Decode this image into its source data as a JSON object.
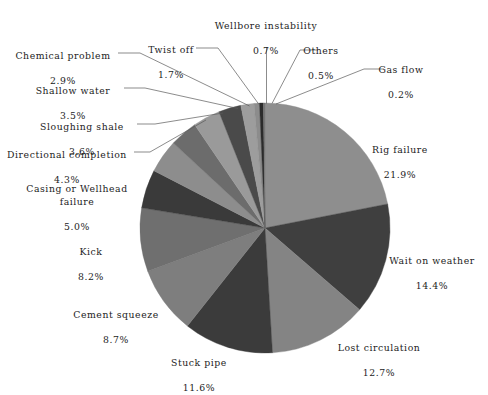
{
  "chart_data": {
    "type": "pie",
    "title": "",
    "subtitle": "",
    "xlabel": "",
    "ylabel": "",
    "legend_position": "callout-labels",
    "grid": false,
    "units": "percent",
    "total": 100.0,
    "start_angle_deg": -90,
    "direction": "clockwise",
    "categories": [
      "Rig failure",
      "Wait on weather",
      "Lost circulation",
      "Stuck pipe",
      "Cement squeeze",
      "Kick",
      "Casing or Wellhead failure",
      "Directional completion",
      "Sloughing shale",
      "Shallow water",
      "Chemical problem",
      "Twist off",
      "Wellbore instability",
      "Others",
      "Gas flow"
    ],
    "values": [
      21.9,
      14.4,
      12.7,
      11.6,
      8.7,
      8.2,
      5.0,
      4.3,
      3.6,
      3.5,
      2.9,
      1.7,
      0.7,
      0.5,
      0.2
    ],
    "value_labels": [
      "21.9%",
      "14.4%",
      "12.7%",
      "11.6%",
      "8.7%",
      "8.2%",
      "5.0%",
      "4.3%",
      "3.6%",
      "3.5%",
      "2.9%",
      "1.7%",
      "0.7%",
      "0.5%",
      "0.2%"
    ],
    "slice_colors": [
      "#8e8e8e",
      "#3f3f3f",
      "#848484",
      "#3b3b3b",
      "#7e7e7e",
      "#6f6f6f",
      "#3a3a3a",
      "#8d8d8d",
      "#6c6c6c",
      "#9a9a9a",
      "#4a4a4a",
      "#9d9d9d",
      "#8c8c8c",
      "#2b2b2b",
      "#767676"
    ],
    "slices": [
      {
        "label": "Rig failure",
        "value": 21.9,
        "value_label": "21.9%",
        "color": "#8e8e8e"
      },
      {
        "label": "Wait on weather",
        "value": 14.4,
        "value_label": "14.4%",
        "color": "#3f3f3f"
      },
      {
        "label": "Lost circulation",
        "value": 12.7,
        "value_label": "12.7%",
        "color": "#848484"
      },
      {
        "label": "Stuck pipe",
        "value": 11.6,
        "value_label": "11.6%",
        "color": "#3b3b3b"
      },
      {
        "label": "Cement squeeze",
        "value": 8.7,
        "value_label": "8.7%",
        "color": "#7e7e7e"
      },
      {
        "label": "Kick",
        "value": 8.2,
        "value_label": "8.2%",
        "color": "#6f6f6f"
      },
      {
        "label": "Casing or Wellhead failure",
        "value": 5.0,
        "value_label": "5.0%",
        "color": "#3a3a3a"
      },
      {
        "label": "Directional completion",
        "value": 4.3,
        "value_label": "4.3%",
        "color": "#8d8d8d"
      },
      {
        "label": "Sloughing shale",
        "value": 3.6,
        "value_label": "3.6%",
        "color": "#6c6c6c"
      },
      {
        "label": "Shallow water",
        "value": 3.5,
        "value_label": "3.5%",
        "color": "#9a9a9a"
      },
      {
        "label": "Chemical problem",
        "value": 2.9,
        "value_label": "2.9%",
        "color": "#4a4a4a"
      },
      {
        "label": "Twist off",
        "value": 1.7,
        "value_label": "1.7%",
        "color": "#9d9d9d"
      },
      {
        "label": "Wellbore instability",
        "value": 0.7,
        "value_label": "0.7%",
        "color": "#8c8c8c"
      },
      {
        "label": "Others",
        "value": 0.5,
        "value_label": "0.5%",
        "color": "#2b2b2b"
      },
      {
        "label": "Gas flow",
        "value": 0.2,
        "value_label": "0.2%",
        "color": "#767676"
      }
    ]
  },
  "labels": {
    "rig_failure": {
      "name": "Rig failure",
      "pct": "21.9%"
    },
    "wait_on_weather": {
      "name": "Wait on weather",
      "pct": "14.4%"
    },
    "lost_circulation": {
      "name": "Lost circulation",
      "pct": "12.7%"
    },
    "stuck_pipe": {
      "name": "Stuck pipe",
      "pct": "11.6%"
    },
    "cement_squeeze": {
      "name": "Cement squeeze",
      "pct": "8.7%"
    },
    "kick": {
      "name": "Kick",
      "pct": "8.2%"
    },
    "casing_wellhead": {
      "name": "Casing or Wellhead\nfailure",
      "pct": "5.0%"
    },
    "directional": {
      "name": "Directional completion",
      "pct": "4.3%"
    },
    "sloughing_shale": {
      "name": "Sloughing shale",
      "pct": "3.6%"
    },
    "shallow_water": {
      "name": "Shallow water",
      "pct": "3.5%"
    },
    "chemical_problem": {
      "name": "Chemical problem",
      "pct": "2.9%"
    },
    "twist_off": {
      "name": "Twist off",
      "pct": "1.7%"
    },
    "wellbore_instab": {
      "name": "Wellbore instability",
      "pct": "0.7%"
    },
    "others": {
      "name": "Others",
      "pct": "0.5%"
    },
    "gas_flow": {
      "name": "Gas flow",
      "pct": "0.2%"
    }
  },
  "geometry": {
    "center_x": 265,
    "center_y": 228,
    "radius": 125
  },
  "style": {
    "background": "#ffffff",
    "text_color": "#1c1c1c",
    "leader_color": "#5a5a5a"
  }
}
